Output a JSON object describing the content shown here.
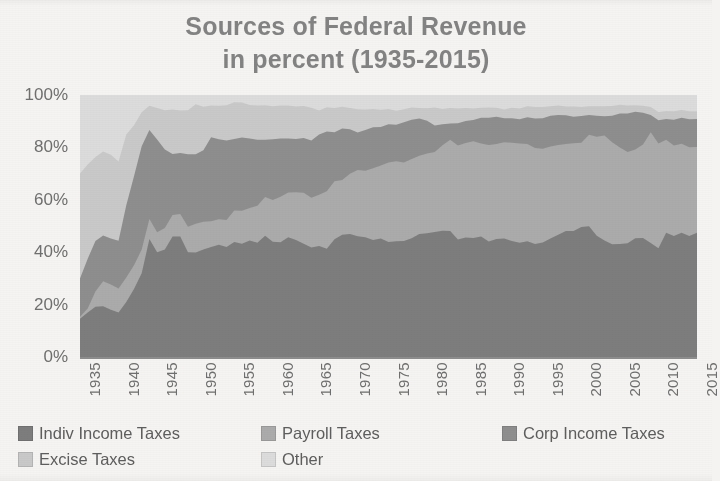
{
  "chart_data": {
    "type": "area",
    "stacked": true,
    "stack_mode": "percent",
    "title": "Sources of Federal Revenue",
    "subtitle": "in percent (1935-2015)",
    "xlabel": "",
    "ylabel": "",
    "ylim": [
      0,
      100
    ],
    "ytick_labels": [
      "0%",
      "20%",
      "40%",
      "60%",
      "80%",
      "100%"
    ],
    "ytick_values": [
      0,
      20,
      40,
      60,
      80,
      100
    ],
    "grid": false,
    "legend_position": "bottom",
    "x_start": 1935,
    "x_end": 2015,
    "xtick_labels": [
      "1935",
      "1940",
      "1945",
      "1950",
      "1955",
      "1960",
      "1965",
      "1970",
      "1975",
      "1980",
      "1985",
      "1990",
      "1995",
      "2000",
      "2005",
      "2010",
      "2015"
    ],
    "x": [
      1935,
      1936,
      1937,
      1938,
      1939,
      1940,
      1941,
      1942,
      1943,
      1944,
      1945,
      1946,
      1947,
      1948,
      1949,
      1950,
      1951,
      1952,
      1953,
      1954,
      1955,
      1956,
      1957,
      1958,
      1959,
      1960,
      1961,
      1962,
      1963,
      1964,
      1965,
      1966,
      1967,
      1968,
      1969,
      1970,
      1971,
      1972,
      1973,
      1974,
      1975,
      1976,
      1977,
      1978,
      1979,
      1980,
      1981,
      1982,
      1983,
      1984,
      1985,
      1986,
      1987,
      1988,
      1989,
      1990,
      1991,
      1992,
      1993,
      1994,
      1995,
      1996,
      1997,
      1998,
      1999,
      2000,
      2001,
      2002,
      2003,
      2004,
      2005,
      2006,
      2007,
      2008,
      2009,
      2010,
      2011,
      2012,
      2013,
      2014,
      2015
    ],
    "series": [
      {
        "name": "Indiv Income Taxes",
        "color": "#7d7d7d",
        "values": [
          14.6,
          17.0,
          19.2,
          19.4,
          18.0,
          17.0,
          21.0,
          26.0,
          32.0,
          45.0,
          40.0,
          41.0,
          46.0,
          46.0,
          40.0,
          39.9,
          41.0,
          42.0,
          42.8,
          42.0,
          43.9,
          43.2,
          44.5,
          43.6,
          46.3,
          44.0,
          43.8,
          45.7,
          44.7,
          43.2,
          41.8,
          42.4,
          41.3,
          44.9,
          46.7,
          46.9,
          46.1,
          45.7,
          44.7,
          45.2,
          43.9,
          44.2,
          44.3,
          45.3,
          47.0,
          47.2,
          47.7,
          48.2,
          48.1,
          44.8,
          45.6,
          45.4,
          46.0,
          44.1,
          45.0,
          45.2,
          44.3,
          43.6,
          44.2,
          43.1,
          43.7,
          45.2,
          46.7,
          48.1,
          48.1,
          49.6,
          49.9,
          46.3,
          44.5,
          43.0,
          43.1,
          43.4,
          45.3,
          45.4,
          43.5,
          41.5,
          47.4,
          46.2,
          47.4,
          46.2,
          47.4
        ]
      },
      {
        "name": "Payroll Taxes",
        "color": "#ababab",
        "values": [
          0.8,
          1.5,
          5.8,
          9.5,
          9.7,
          9.1,
          9.3,
          9.0,
          9.0,
          7.7,
          7.6,
          8.2,
          8.2,
          8.6,
          9.7,
          11.0,
          10.6,
          9.8,
          9.8,
          10.3,
          12.0,
          12.6,
          12.4,
          14.1,
          14.8,
          15.9,
          17.4,
          17.1,
          18.2,
          19.5,
          19.0,
          19.5,
          22.0,
          22.2,
          20.9,
          23.0,
          25.3,
          25.4,
          27.3,
          27.9,
          30.3,
          30.5,
          29.9,
          30.3,
          30.0,
          30.5,
          30.5,
          32.6,
          34.8,
          35.9,
          36.1,
          36.9,
          35.5,
          36.8,
          36.3,
          36.8,
          37.5,
          37.9,
          37.1,
          36.7,
          35.8,
          35.1,
          34.2,
          33.2,
          33.5,
          32.2,
          34.9,
          37.8,
          40.0,
          39.0,
          36.9,
          34.8,
          33.9,
          35.7,
          42.3,
          40.0,
          35.5,
          34.5,
          34.0,
          33.9,
          32.8
        ]
      },
      {
        "name": "Corp Income Taxes",
        "color": "#8e8e8e",
        "values": [
          14.6,
          19.0,
          19.3,
          17.5,
          17.5,
          18.3,
          27.6,
          34.0,
          39.4,
          33.9,
          35.4,
          30.0,
          23.3,
          23.3,
          27.7,
          26.5,
          27.3,
          32.1,
          30.5,
          30.3,
          27.3,
          28.0,
          26.5,
          25.2,
          21.8,
          23.2,
          22.2,
          20.6,
          20.3,
          20.9,
          21.8,
          23.0,
          22.8,
          18.7,
          19.6,
          17.0,
          14.3,
          15.5,
          15.7,
          14.7,
          14.6,
          13.9,
          15.4,
          15.0,
          14.2,
          12.5,
          10.2,
          8.0,
          6.2,
          8.5,
          8.4,
          8.2,
          9.8,
          10.4,
          10.4,
          9.1,
          9.3,
          9.2,
          10.2,
          11.2,
          11.6,
          11.8,
          11.5,
          11.0,
          10.1,
          10.2,
          7.6,
          8.0,
          7.4,
          10.1,
          12.9,
          14.7,
          14.4,
          12.1,
          6.6,
          8.9,
          7.9,
          9.9,
          9.9,
          10.6,
          10.6
        ]
      },
      {
        "name": "Excise Taxes",
        "color": "#c9c9c9",
        "values": [
          40.0,
          36.0,
          32.0,
          32.0,
          32.0,
          30.2,
          27.0,
          19.5,
          13.0,
          9.3,
          12.0,
          15.0,
          17.0,
          16.2,
          16.8,
          19.1,
          16.6,
          12.1,
          12.8,
          13.5,
          14.0,
          13.3,
          12.8,
          13.1,
          13.2,
          12.6,
          12.6,
          12.6,
          12.4,
          12.2,
          12.5,
          9.2,
          9.2,
          9.2,
          8.3,
          8.1,
          8.9,
          7.9,
          7.0,
          6.6,
          5.9,
          5.4,
          5.0,
          4.6,
          4.0,
          4.7,
          6.8,
          5.9,
          5.9,
          5.6,
          4.9,
          4.3,
          3.8,
          3.9,
          3.4,
          3.4,
          4.0,
          4.1,
          4.2,
          4.4,
          4.3,
          3.6,
          3.6,
          3.3,
          3.9,
          3.4,
          3.3,
          3.6,
          3.8,
          3.7,
          3.4,
          3.1,
          2.5,
          2.7,
          3.0,
          3.1,
          3.1,
          3.2,
          3.0,
          3.1,
          3.0
        ]
      },
      {
        "name": "Other",
        "color": "#dcdcdc",
        "values": [
          30.0,
          26.5,
          23.7,
          21.6,
          22.8,
          25.4,
          15.1,
          11.5,
          6.6,
          4.1,
          5.0,
          5.8,
          5.5,
          5.9,
          5.8,
          3.5,
          4.5,
          4.0,
          4.1,
          3.9,
          2.8,
          2.9,
          3.8,
          4.0,
          3.9,
          4.3,
          4.0,
          4.0,
          4.4,
          4.2,
          4.9,
          5.9,
          4.7,
          5.0,
          4.5,
          5.0,
          5.4,
          5.5,
          5.3,
          5.6,
          5.3,
          6.0,
          5.4,
          4.8,
          5.0,
          5.1,
          4.8,
          5.3,
          5.0,
          5.2,
          5.0,
          5.2,
          4.9,
          4.8,
          4.9,
          5.5,
          4.9,
          5.2,
          4.3,
          4.6,
          4.6,
          4.3,
          4.0,
          4.4,
          4.4,
          4.6,
          4.3,
          4.3,
          4.3,
          4.2,
          3.7,
          4.0,
          3.9,
          4.1,
          4.6,
          6.5,
          6.1,
          6.2,
          5.7,
          6.2,
          6.2
        ]
      }
    ]
  },
  "legend": {
    "items": [
      {
        "label": "Indiv Income Taxes",
        "color": "#7d7d7d"
      },
      {
        "label": "Payroll Taxes",
        "color": "#ababab"
      },
      {
        "label": "Corp Income Taxes",
        "color": "#8e8e8e"
      },
      {
        "label": "Excise Taxes",
        "color": "#c9c9c9"
      },
      {
        "label": "Other",
        "color": "#dcdcdc"
      }
    ]
  },
  "style": {
    "title_color": "#838383",
    "tick_color": "#6f6f6f",
    "axis_color": "#8d8d8d",
    "page_background": "#f5f4f2"
  }
}
